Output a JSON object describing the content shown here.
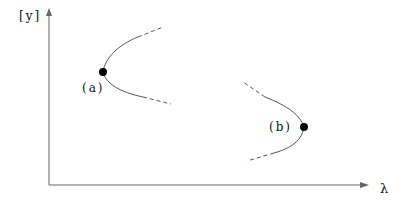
{
  "diagram": {
    "type": "bifurcation-sketch",
    "axes": {
      "y_label": "[y]",
      "x_label": "λ"
    },
    "points": [
      {
        "id": "a",
        "label": "(a)",
        "opening": "right",
        "description": "fold point, branches open toward increasing λ"
      },
      {
        "id": "b",
        "label": "(b)",
        "opening": "left",
        "description": "fold point, branches open toward decreasing λ"
      }
    ],
    "legend_styles": {
      "solid": "computed branch",
      "dashed": "continuation"
    },
    "colors": {
      "line": "#555555",
      "axis": "#666666",
      "point": "#000000"
    }
  }
}
